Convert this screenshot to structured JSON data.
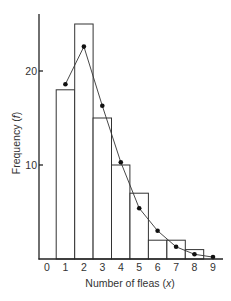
{
  "chart_data": {
    "type": "bar",
    "title": "",
    "xlabel": "Number of fleas (x)",
    "ylabel": "Frequency (f)",
    "categories": [
      "0",
      "1",
      "2",
      "3",
      "4",
      "5",
      "6",
      "7",
      "8",
      "9"
    ],
    "x": [
      0,
      1,
      2,
      3,
      4,
      5,
      6,
      7,
      8,
      9
    ],
    "series": [
      {
        "name": "Observed frequency",
        "type": "bar",
        "values": [
          0,
          18,
          25,
          15,
          10,
          7,
          2,
          2,
          1,
          0
        ]
      },
      {
        "name": "Fitted (expected) frequency",
        "type": "line",
        "marker": "dot",
        "x": [
          1,
          2,
          3,
          4,
          5,
          6,
          7,
          8,
          9
        ],
        "values": [
          18.6,
          22.6,
          16.3,
          10.3,
          5.4,
          3.0,
          1.3,
          0.5,
          0.2
        ]
      }
    ],
    "yticks": [
      10,
      20
    ],
    "ylim": [
      0,
      26
    ],
    "xlim": [
      -0.5,
      9.5
    ],
    "grid": false,
    "legend": null
  },
  "axes": {
    "x_label": "Number of fleas (",
    "x_label_var": "x",
    "x_label_close": ")",
    "y_label": "Frequency (",
    "y_label_var": "f",
    "y_label_close": ")",
    "x_tick_labels": [
      "0",
      "1",
      "2",
      "3",
      "4",
      "5",
      "6",
      "7",
      "8",
      "9"
    ],
    "y_tick_labels": [
      "10",
      "20"
    ]
  }
}
